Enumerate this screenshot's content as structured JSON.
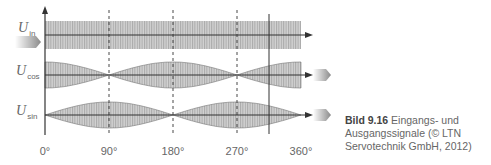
{
  "signals": [
    {
      "id": "in",
      "label_main": "U",
      "label_sub": "in",
      "center_y": 35,
      "type": "constant",
      "amplitude": 13
    },
    {
      "id": "cos",
      "label_main": "U",
      "label_sub": "cos",
      "center_y": 75,
      "type": "cos-envelope",
      "amplitude": 13
    },
    {
      "id": "sin",
      "label_main": "U",
      "label_sub": "sin",
      "center_y": 115,
      "type": "sin-envelope",
      "amplitude": 13
    }
  ],
  "x_axis": {
    "ticks": [
      {
        "label": "0°",
        "x": 45
      },
      {
        "label": "90°",
        "x": 109
      },
      {
        "label": "180°",
        "x": 173
      },
      {
        "label": "270°",
        "x": 237
      },
      {
        "label": "360°",
        "x": 301
      }
    ]
  },
  "caption": {
    "number": "Bild 9.16",
    "text": " Eingangs- und Ausgangssignale (© LTN Servotechnik GmbH, 2012)"
  },
  "colors": {
    "band": "#c8c8c8",
    "hatch": "#a8a8a8",
    "axis": "#333333",
    "arrow": "#999999"
  }
}
